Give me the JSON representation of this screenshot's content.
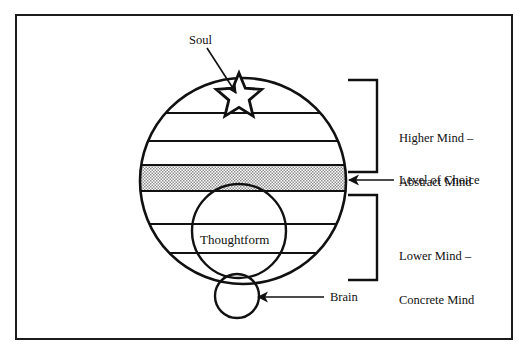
{
  "diagram": {
    "frame": {
      "border_color": "#1c1c1c",
      "background": "#ffffff"
    },
    "colors": {
      "stroke": "#111111",
      "band_fill": "#b8b8b8",
      "band_pattern": "#ffffff",
      "text": "#111111"
    },
    "labels": {
      "soul": "Soul",
      "higher_mind_line1": "Higher Mind –",
      "higher_mind_line2": "Abstract Mind",
      "level_of_choice": "Level of Choice",
      "lower_mind_line1": "Lower Mind –",
      "lower_mind_line2": "Concrete Mind",
      "brain": "Brain",
      "thoughtform": "Thoughtform"
    },
    "shapes": {
      "mind_circle": {
        "name": "mind-circle",
        "cx": 243,
        "cy": 181,
        "r": 103
      },
      "thoughtform_circle": {
        "name": "thoughtform-circle",
        "cx": 239,
        "cy": 231,
        "r": 47
      },
      "brain_circle": {
        "name": "brain-circle",
        "cx": 237,
        "cy": 296,
        "r": 22
      },
      "soul_star": {
        "name": "soul-star",
        "cx": 239,
        "cy": 95,
        "outer_r": 22,
        "inner_r": 9
      }
    },
    "division_lines_y": [
      113,
      141,
      224,
      253
    ],
    "choice_band": {
      "top_y": 165,
      "bottom_y": 191
    },
    "brackets": {
      "higher": {
        "top_y": 80,
        "bottom_y": 172,
        "x_left": 348,
        "x_spine": 377
      },
      "lower": {
        "top_y": 195,
        "bottom_y": 280,
        "x_left": 348,
        "x_spine": 377
      }
    },
    "arrows": {
      "soul": {
        "from_x": 207,
        "from_y": 48,
        "to_x": 235,
        "to_y": 92
      },
      "level_of_choice": {
        "from_x": 394,
        "from_y": 180,
        "to_x": 347,
        "to_y": 180
      },
      "brain": {
        "from_x": 324,
        "from_y": 297,
        "to_x": 257,
        "to_y": 297
      }
    }
  }
}
